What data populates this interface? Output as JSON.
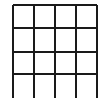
{
  "figure": {
    "kind": "grid-drawing",
    "background_color": "#ffffff",
    "line_color": "#1a1a1a",
    "line_width": 1.6,
    "canvas": {
      "width": 110,
      "height": 98
    },
    "grid": {
      "rows": 4,
      "columns": 4,
      "cell_width": 21,
      "cell_height": 23,
      "bottom_edge_cropped": true,
      "vertical_lines": [
        {
          "name": "vertical-line-1",
          "x": 13,
          "y1": 5,
          "y2": 98
        },
        {
          "name": "vertical-line-2",
          "x": 34,
          "y1": 5,
          "y2": 98
        },
        {
          "name": "vertical-line-3",
          "x": 55,
          "y1": 5,
          "y2": 98
        },
        {
          "name": "vertical-line-4",
          "x": 76,
          "y1": 5,
          "y2": 98
        },
        {
          "name": "vertical-line-5",
          "x": 97,
          "y1": 5,
          "y2": 98
        }
      ],
      "horizontal_lines": [
        {
          "name": "horizontal-line-1",
          "y": 5,
          "x1": 13,
          "x2": 97
        },
        {
          "name": "horizontal-line-2",
          "y": 28,
          "x1": 13,
          "x2": 97
        },
        {
          "name": "horizontal-line-3",
          "y": 52,
          "x1": 13,
          "x2": 97
        },
        {
          "name": "horizontal-line-4",
          "y": 74,
          "x1": 13,
          "x2": 97
        }
      ]
    }
  }
}
